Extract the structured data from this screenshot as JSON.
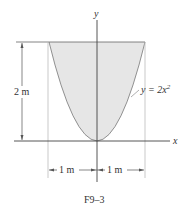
{
  "figure": {
    "caption": "F9–3",
    "axes": {
      "x_label": "x",
      "y_label": "y"
    },
    "curve_label": "y = 2x",
    "curve_label_exponent": "2",
    "height_dimension": "2 m",
    "left_width_dimension": "1 m",
    "right_width_dimension": "1 m",
    "colors": {
      "fill": "#e6e6e6",
      "line": "#555555",
      "light_line": "#bbbbbb",
      "text": "#333333"
    }
  }
}
